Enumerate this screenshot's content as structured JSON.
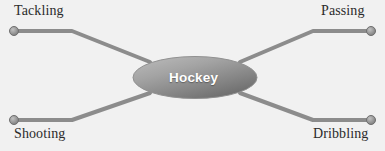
{
  "diagram": {
    "type": "mind-map",
    "center": {
      "id": "hockey",
      "label": "Hockey",
      "shape": "ellipse",
      "text_color": "#ffffff",
      "fill_light": "#adadad",
      "fill_dark": "#6e6e6e",
      "stroke": "#8a8a8a",
      "cx": 195,
      "cy": 77.5,
      "rx": 62,
      "ry": 21
    },
    "background_color": "#f1f1f1",
    "branch_color": "#8c8c8c",
    "branch_width": 4,
    "endpoint_fill": "#9a9a9a",
    "endpoint_stroke": "#6f6f6f",
    "endpoint_radius": 4.5,
    "branches": [
      {
        "id": "tackling",
        "label": "Tackling",
        "position": "top-left",
        "endpoint": {
          "x": 14,
          "y": 31
        },
        "elbow": {
          "x": 72,
          "y": 31
        },
        "inner": {
          "x": 150,
          "y": 62
        },
        "label_x": 14,
        "label_y": 3
      },
      {
        "id": "passing",
        "label": "Passing",
        "position": "top-right",
        "endpoint": {
          "x": 371,
          "y": 31
        },
        "elbow": {
          "x": 313,
          "y": 31
        },
        "inner": {
          "x": 240,
          "y": 62
        },
        "label_x": 321,
        "label_y": 3
      },
      {
        "id": "shooting",
        "label": "Shooting",
        "position": "bottom-left",
        "endpoint": {
          "x": 14,
          "y": 120
        },
        "elbow": {
          "x": 72,
          "y": 120
        },
        "inner": {
          "x": 150,
          "y": 93
        },
        "label_x": 14,
        "label_y": 126
      },
      {
        "id": "dribbling",
        "label": "Dribbling",
        "position": "bottom-right",
        "endpoint": {
          "x": 371,
          "y": 120
        },
        "elbow": {
          "x": 313,
          "y": 120
        },
        "inner": {
          "x": 240,
          "y": 93
        },
        "label_x": 313,
        "label_y": 126
      }
    ]
  }
}
